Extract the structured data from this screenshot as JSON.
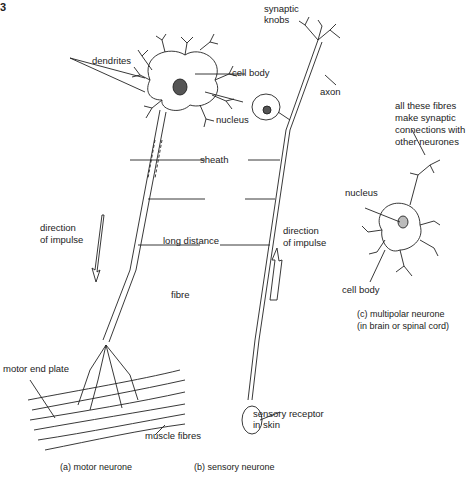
{
  "figure_number": "3",
  "labels": {
    "dendrites": "dendrites",
    "cell_body_a": "cell body",
    "nucleus_a": "nucleus",
    "synaptic_knobs_1": "synaptic",
    "synaptic_knobs_2": "knobs",
    "axon": "axon",
    "sheath": "sheath",
    "long_distance": "long distance",
    "fibre": "fibre",
    "direction_a_1": "direction",
    "direction_a_2": "of impulse",
    "direction_b_1": "direction",
    "direction_b_2": "of impulse",
    "all_fibres_1": "all these fibres",
    "all_fibres_2": "make synaptic",
    "all_fibres_3": "connections with",
    "all_fibres_4": "other neurones",
    "nucleus_c": "nucleus",
    "cell_body_c": "cell body",
    "motor_end_plate": "motor end plate",
    "muscle_fibres": "muscle fibres",
    "sensory_receptor_1": "sensory receptor",
    "sensory_receptor_2": "in skin"
  },
  "captions": {
    "a": "(a)  motor neurone",
    "b": "(b)  sensory neurone",
    "c_1": "(c)  multipolar neurone",
    "c_2": "(in brain or spinal cord)"
  }
}
